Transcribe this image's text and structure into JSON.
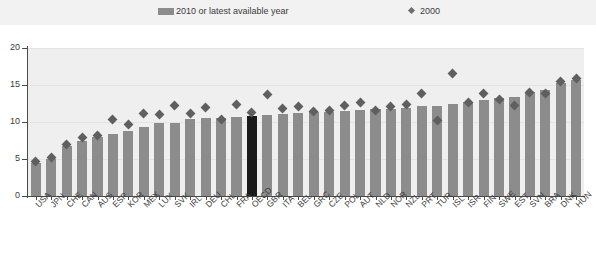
{
  "legend": {
    "items": [
      {
        "label": "2010 or latest available year",
        "marker": "bar-swatch-icon",
        "color": "#8c8c8c"
      },
      {
        "label": "2000",
        "marker": "diamond-icon",
        "color": "#6e6e6e"
      }
    ]
  },
  "axes": {
    "y_ticks": [
      "20",
      "15",
      "10",
      "5",
      "0"
    ],
    "y_min": 0,
    "y_max": 20
  },
  "colors": {
    "bar": "#8c8c8c",
    "bar_highlight": "#1a1a1a",
    "diamond": "#5f5f5f",
    "plot_background": "#efefef",
    "legend_background": "#f2f2f2",
    "axis": "#4a4a4a",
    "gridline": "#e4e4e4"
  },
  "chart_data": {
    "type": "bar",
    "title": "",
    "subtitle": "",
    "xlabel": "",
    "ylabel": "",
    "ylim": [
      0,
      20
    ],
    "grid": true,
    "legend_position": "top",
    "categories": [
      "USA",
      "JPN",
      "CHE",
      "CAN",
      "AUS",
      "ESP",
      "KOR",
      "MEX",
      "LUX",
      "SVK",
      "IRL",
      "DEU",
      "CHL",
      "FRA",
      "OECD",
      "GBR",
      "ITA",
      "BEL",
      "GRC",
      "CZE",
      "POL",
      "AUT",
      "NLD",
      "NOR",
      "NZL",
      "PRT",
      "TUR",
      "ISL",
      "ISR",
      "FIN",
      "SWE",
      "EST",
      "SVN",
      "BRA",
      "DNK",
      "HUN"
    ],
    "highlight_category": "OECD",
    "series": [
      {
        "name": "2010 or latest available year",
        "type": "bar",
        "values": [
          4.4,
          5.0,
          6.7,
          7.5,
          8.0,
          8.4,
          8.8,
          9.3,
          9.9,
          9.9,
          10.4,
          10.5,
          10.6,
          10.7,
          10.8,
          10.9,
          11.1,
          11.2,
          11.3,
          11.4,
          11.5,
          11.6,
          11.7,
          11.8,
          11.9,
          12.1,
          12.2,
          12.5,
          12.7,
          13.0,
          13.2,
          13.4,
          14.0,
          14.3,
          15.3,
          15.7
        ]
      },
      {
        "name": "2000",
        "type": "scatter",
        "marker": "diamond",
        "values": [
          4.6,
          5.2,
          6.9,
          7.9,
          8.2,
          10.4,
          9.7,
          11.1,
          11.0,
          12.2,
          11.2,
          12.0,
          10.3,
          12.4,
          11.3,
          13.7,
          11.8,
          12.1,
          11.4,
          11.6,
          12.2,
          12.7,
          11.5,
          12.1,
          12.4,
          13.9,
          10.2,
          16.5,
          12.6,
          13.8,
          13.1,
          12.2,
          14.0,
          13.8,
          15.5,
          15.9
        ]
      }
    ]
  }
}
